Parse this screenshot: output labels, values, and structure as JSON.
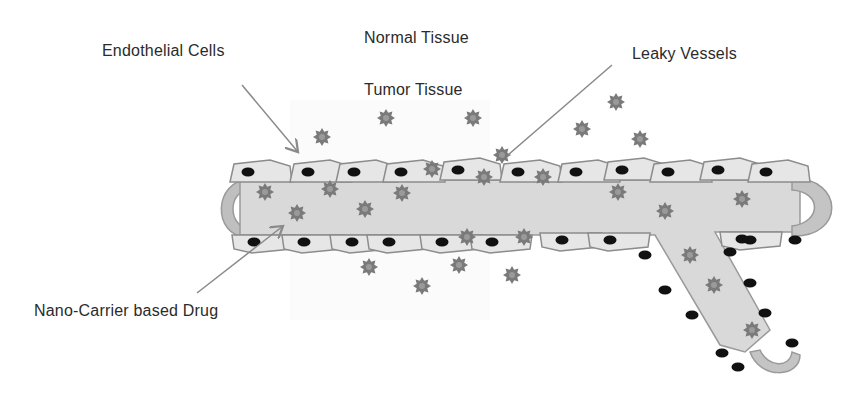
{
  "labels": {
    "endothelial_cells": "Endothelial Cells",
    "normal_tissue": "Normal Tissue",
    "tumor_tissue": "Tumor Tissue",
    "leaky_vessels": "Leaky Vessels",
    "nano_carrier_drug": "Nano-Carrier based Drug"
  },
  "colors": {
    "background": "#ffffff",
    "text": "#2b2b2b",
    "vessel_lumen": "#d9d9d9",
    "vessel_cap": "#bfbfbf",
    "endothelial_cell": "#e6e6e6",
    "cell_outline": "#8c8c8c",
    "nucleus": "#111111",
    "drug_particle": "#7a7a7a",
    "arrow": "#8a8a8a"
  }
}
